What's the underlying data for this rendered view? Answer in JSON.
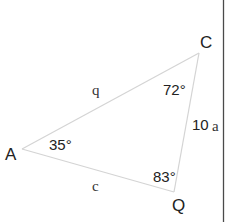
{
  "diagram": {
    "type": "triangle",
    "vertices": {
      "A": {
        "label": "A",
        "angle": "35°"
      },
      "C": {
        "label": "C",
        "angle": "72°"
      },
      "Q": {
        "label": "Q",
        "angle": "83°"
      }
    },
    "sides": {
      "AC": {
        "label": "q"
      },
      "AQ": {
        "label": "c"
      },
      "CQ": {
        "label": "a",
        "length": "10"
      }
    },
    "colors": {
      "edge": "#d4d4d4",
      "text": "#222222",
      "border": "#4a4a4a"
    }
  }
}
